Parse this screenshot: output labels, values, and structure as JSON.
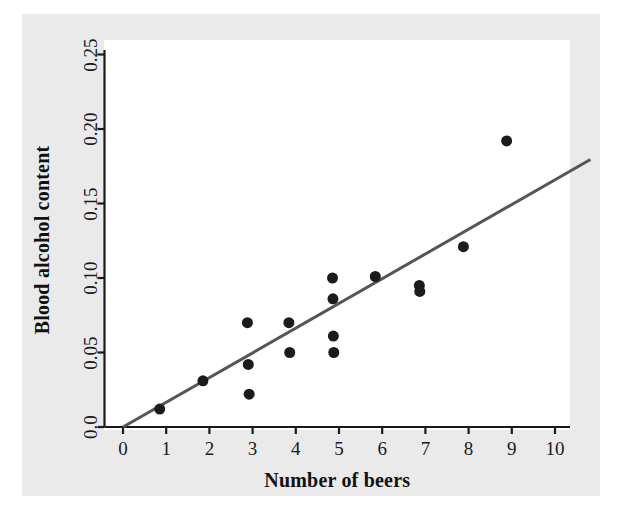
{
  "chart_data": {
    "type": "scatter",
    "title": "",
    "xlabel": "Number of beers",
    "ylabel": "Blood alcohol content",
    "xlim": [
      -0.3,
      10.8
    ],
    "ylim": [
      -0.006,
      0.26
    ],
    "xticks": [
      0,
      1,
      2,
      3,
      4,
      5,
      6,
      7,
      8,
      9,
      10
    ],
    "xtick_labels": [
      "0",
      "1",
      "2",
      "3",
      "4",
      "5",
      "6",
      "7",
      "8",
      "9",
      "10"
    ],
    "yticks": [
      0.0,
      0.05,
      0.1,
      0.15,
      0.2,
      0.25
    ],
    "ytick_labels": [
      "0.0",
      "0.05",
      "0.10",
      "0.15",
      "0.20",
      "0.25"
    ],
    "grid": false,
    "legend": null,
    "marker_color": "#1b1b1b",
    "marker_size": 9,
    "points": [
      {
        "x": 0.85,
        "y": 0.012
      },
      {
        "x": 1.85,
        "y": 0.031
      },
      {
        "x": 2.88,
        "y": 0.07
      },
      {
        "x": 2.9,
        "y": 0.042
      },
      {
        "x": 2.92,
        "y": 0.022
      },
      {
        "x": 3.84,
        "y": 0.07
      },
      {
        "x": 3.86,
        "y": 0.05
      },
      {
        "x": 4.85,
        "y": 0.1
      },
      {
        "x": 4.86,
        "y": 0.086
      },
      {
        "x": 4.87,
        "y": 0.061
      },
      {
        "x": 4.88,
        "y": 0.05
      },
      {
        "x": 5.84,
        "y": 0.101
      },
      {
        "x": 6.86,
        "y": 0.095
      },
      {
        "x": 6.87,
        "y": 0.091
      },
      {
        "x": 7.88,
        "y": 0.121
      },
      {
        "x": 8.88,
        "y": 0.192
      }
    ],
    "fit_line": {
      "name": "least-squares regression line",
      "color": "#55555b",
      "width": 3,
      "x_start": 0.0,
      "y_start": 0.0,
      "x_end": 10.82,
      "y_end": 0.1795,
      "slope": 0.01659,
      "intercept": 0.0
    }
  }
}
